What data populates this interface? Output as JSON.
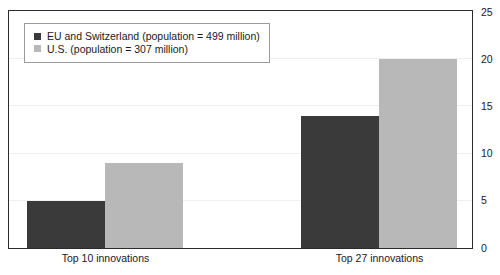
{
  "chart_data": {
    "type": "bar",
    "title": "",
    "subtitle": "",
    "xlabel": "",
    "ylabel": "",
    "ylim": [
      0,
      25
    ],
    "yticks": [
      0,
      5,
      10,
      15,
      20,
      25
    ],
    "ytick_labels": [
      "0",
      "5",
      "10",
      "15",
      "20",
      "25"
    ],
    "grid": true,
    "legend_position": "top-left",
    "categories": [
      "Top 10 innovations",
      "Top 27 innovations"
    ],
    "series": [
      {
        "name": "EU and Switzerland (population = 499 million)",
        "color": "#3a3a3a",
        "values": [
          5,
          14
        ]
      },
      {
        "name": "U.S. (population = 307 million)",
        "color": "#b8b8b8",
        "values": [
          9,
          20
        ]
      }
    ]
  },
  "legend": {
    "items": [
      {
        "label": "EU and Switzerland (population = 499 million)",
        "color": "#3a3a3a"
      },
      {
        "label": "U.S. (population = 307 million)",
        "color": "#b8b8b8"
      }
    ]
  },
  "axis": {
    "y_tick_labels": [
      "25",
      "20",
      "15",
      "10",
      "5",
      "0"
    ],
    "x_tick_labels": [
      "Top 10 innovations",
      "Top 27 innovations"
    ]
  },
  "colors": {
    "series_eu": "#3a3a3a",
    "series_us": "#b8b8b8",
    "frame": "#2b2b2b",
    "gridline": "#f0f0f2",
    "legend_border": "#9a9aa0",
    "background": "#ffffff"
  }
}
